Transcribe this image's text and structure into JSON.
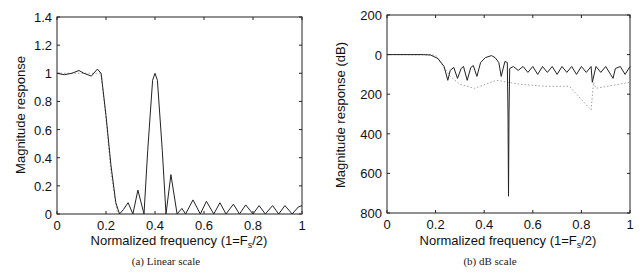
{
  "chart_data": [
    {
      "type": "line",
      "panel": "a",
      "caption": "(a) Linear scale",
      "title": "",
      "xlabel": "Normalized frequency (1=F_s/2)",
      "xlabel_main": "Normalized frequency (1=F",
      "xlabel_sub": "s",
      "xlabel_end": "/2)",
      "ylabel": "Magnitude response",
      "xlim": [
        0,
        1
      ],
      "ylim": [
        0,
        1.4
      ],
      "xticks": [
        "0",
        "0.2",
        "0.4",
        "0.6",
        "0.8",
        "1"
      ],
      "yticks": [
        "0",
        "0.2",
        "0.4",
        "0.6",
        "0.8",
        "1",
        "1.2",
        "1.4"
      ],
      "grid": false,
      "series": [
        {
          "name": "designed response",
          "style": "solid",
          "x": [
            0,
            0.03,
            0.06,
            0.09,
            0.11,
            0.14,
            0.165,
            0.18,
            0.2,
            0.22,
            0.24,
            0.255,
            0.27,
            0.29,
            0.31,
            0.33,
            0.355,
            0.37,
            0.39,
            0.4,
            0.41,
            0.43,
            0.445,
            0.465,
            0.49,
            0.51,
            0.525,
            0.555,
            0.585,
            0.61,
            0.64,
            0.665,
            0.69,
            0.72,
            0.745,
            0.77,
            0.8,
            0.825,
            0.85,
            0.88,
            0.905,
            0.93,
            0.96,
            0.985,
            1
          ],
          "y": [
            1.0,
            0.99,
            1.0,
            1.02,
            1.0,
            0.98,
            1.03,
            1.0,
            0.7,
            0.35,
            0.08,
            0.0,
            0.03,
            0.08,
            0.0,
            0.17,
            0.0,
            0.45,
            0.95,
            1.0,
            0.95,
            0.45,
            0.0,
            0.28,
            0.0,
            0.04,
            0.0,
            0.1,
            0.0,
            0.09,
            0.0,
            0.08,
            0.0,
            0.07,
            0.0,
            0.065,
            0.0,
            0.06,
            0.0,
            0.06,
            0.0,
            0.06,
            0.0,
            0.05,
            0.06
          ]
        },
        {
          "name": "reference response",
          "style": "dotted",
          "x": [
            0,
            0.18,
            0.2,
            0.22,
            0.245,
            0.26,
            1
          ],
          "y": [
            1.0,
            1.0,
            0.68,
            0.3,
            0.02,
            0.0,
            0.0
          ]
        }
      ]
    },
    {
      "type": "line",
      "panel": "b",
      "caption": "(b) dB scale",
      "title": "",
      "xlabel": "Normalized frequency (1=F_s/2)",
      "xlabel_main": "Normalized frequency (1=F",
      "xlabel_sub": "s",
      "xlabel_end": "/2)",
      "ylabel": "Magnitude response (dB)",
      "xlim": [
        0,
        1
      ],
      "ylim": [
        -200,
        800
      ],
      "y_axis_inverted": true,
      "xticks": [
        "0",
        "0.2",
        "0.4",
        "0.6",
        "0.8",
        "1"
      ],
      "yticks": [
        "200",
        "0",
        "200",
        "400",
        "600",
        "800"
      ],
      "grid": false,
      "series": [
        {
          "name": "designed response",
          "style": "solid",
          "x": [
            0,
            0.15,
            0.18,
            0.21,
            0.235,
            0.25,
            0.26,
            0.275,
            0.29,
            0.305,
            0.315,
            0.33,
            0.345,
            0.355,
            0.37,
            0.385,
            0.405,
            0.43,
            0.445,
            0.46,
            0.47,
            0.485,
            0.495,
            0.498,
            0.5,
            0.502,
            0.505,
            0.52,
            0.54,
            0.56,
            0.58,
            0.6,
            0.62,
            0.64,
            0.66,
            0.68,
            0.7,
            0.72,
            0.74,
            0.76,
            0.78,
            0.8,
            0.82,
            0.84,
            0.845,
            0.86,
            0.88,
            0.9,
            0.92,
            0.93,
            0.94,
            0.96,
            0.98,
            1
          ],
          "y": [
            0,
            0,
            2,
            20,
            60,
            130,
            80,
            65,
            120,
            70,
            60,
            130,
            65,
            55,
            110,
            40,
            15,
            5,
            15,
            40,
            110,
            35,
            40,
            300,
            715,
            300,
            70,
            60,
            80,
            60,
            90,
            60,
            100,
            60,
            90,
            60,
            100,
            60,
            90,
            60,
            100,
            60,
            90,
            60,
            140,
            60,
            90,
            60,
            100,
            120,
            70,
            60,
            100,
            60
          ]
        },
        {
          "name": "reference response",
          "style": "dotted",
          "x": [
            0,
            0.2,
            0.26,
            0.3,
            0.36,
            0.45,
            0.55,
            0.65,
            0.75,
            0.84,
            0.85,
            0.86,
            1
          ],
          "y": [
            0,
            2,
            110,
            150,
            170,
            130,
            150,
            160,
            160,
            280,
            140,
            170,
            140
          ]
        }
      ]
    }
  ]
}
